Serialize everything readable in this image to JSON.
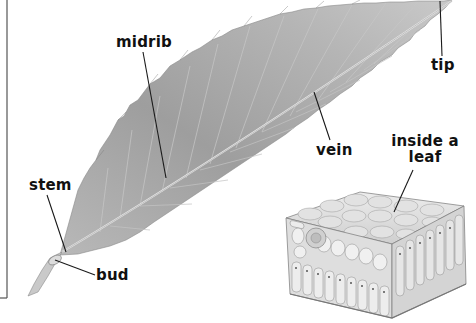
{
  "diagram": {
    "labels": {
      "midrib": "midrib",
      "tip": "tip",
      "vein": "vein",
      "inside_leaf_line1": "inside a",
      "inside_leaf_line2": "leaf",
      "stem": "stem",
      "bud": "bud"
    },
    "colors": {
      "background": "#ffffff",
      "leaf_light": "#d6d6d6",
      "leaf_mid": "#a9a9a9",
      "leaf_dark": "#7d7d7d",
      "line": "#1a1a1a",
      "border": "#555555"
    }
  }
}
